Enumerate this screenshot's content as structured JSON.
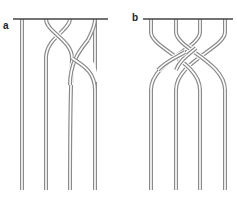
{
  "figure": {
    "panels": [
      {
        "label": "a",
        "description": "Four strands hanging from a bar; strands 2 and 3 wrap around each other (two crossings), strands 1 and 4 straight",
        "bar": {
          "x1": 13,
          "x2": 108,
          "y": 19
        },
        "strand_x_top": [
          22,
          46,
          70,
          95
        ],
        "strand_x_bottom": [
          22,
          46,
          70,
          95
        ],
        "crossings": 2
      },
      {
        "label": "b",
        "description": "Four strands hanging from a bar; outer and inner strands interleave producing four crossings",
        "bar": {
          "x1": 143,
          "x2": 233,
          "y": 19
        },
        "strand_x_top": [
          151,
          176,
          200,
          225
        ],
        "strand_x_bottom": [
          151,
          176,
          200,
          225
        ],
        "crossings": 4
      }
    ],
    "colors": {
      "strand_outline": "#8a8a8a",
      "strand_fill": "#ffffff",
      "bar": "#444444",
      "label": "#222222"
    }
  }
}
